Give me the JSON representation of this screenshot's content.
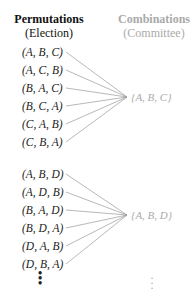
{
  "headers": {
    "left": {
      "title": "Permutations",
      "subtitle": "(Election)"
    },
    "right": {
      "title": "Combinations",
      "subtitle": "(Committee)"
    }
  },
  "groups": [
    {
      "permutations": [
        "(A, B, C)",
        "(A, C, B)",
        "(B, A, C)",
        "(B, C, A)",
        "(C, A, B)",
        "(C, B, A)"
      ],
      "combination": "{A, B, C}"
    },
    {
      "permutations": [
        "(A, B, D)",
        "(A, D, B)",
        "(B, A, D)",
        "(B, D, A)",
        "(D, A, B)",
        "(D, B, A)"
      ],
      "combination": "{A, B, D}"
    }
  ],
  "continuation": {
    "left": "⋮",
    "right": "⋮"
  },
  "colors": {
    "text": "#222222",
    "muted": "#aaaaaa",
    "line": "#9a9a9a"
  }
}
